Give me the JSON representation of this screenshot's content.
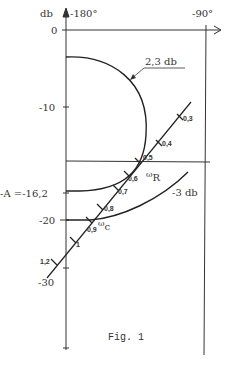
{
  "figure": {
    "caption": "Fig. 1",
    "y_unit": "db",
    "x_labels": {
      "left": "-180°",
      "right": "-90°"
    }
  },
  "axes": {
    "y_ticks": [
      {
        "label": "0",
        "value": 0
      },
      {
        "label": "-10",
        "value": -10
      },
      {
        "label": "-20",
        "value": -20
      },
      {
        "label": "-30",
        "value": -30
      }
    ],
    "special_level": {
      "label": "-A =-16,2",
      "value": -16.2
    }
  },
  "curves": {
    "m_circle_high": {
      "label": "2,3 db"
    },
    "m_circle_low": {
      "label": "-3 db"
    }
  },
  "frequency_locus": {
    "points": [
      {
        "label": "0,3"
      },
      {
        "label": "0,4"
      },
      {
        "label": "0,5"
      },
      {
        "label": "0,6"
      },
      {
        "label": "0,7"
      },
      {
        "label": "0,8"
      },
      {
        "label": "0,9"
      },
      {
        "label": "1"
      },
      {
        "label": "1,2"
      }
    ],
    "omega_R": {
      "symbol": "ω",
      "sub": "R"
    },
    "omega_C": {
      "symbol": "ω",
      "sub": "c"
    }
  },
  "colors": {
    "ink": "#333333",
    "paper": "#ffffff"
  }
}
